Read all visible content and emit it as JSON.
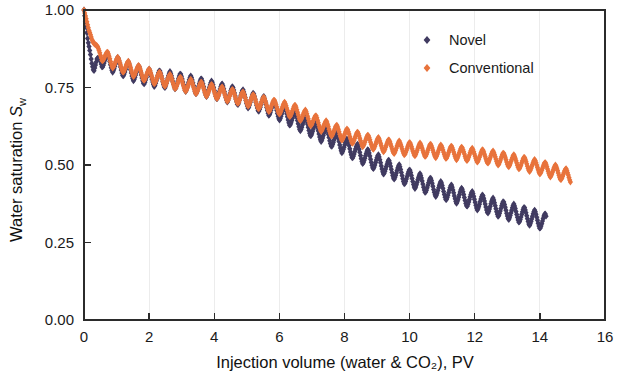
{
  "chart_data": {
    "type": "line",
    "title": "",
    "xlabel": "Injection volume (water & CO₂), PV",
    "ylabel": "Water saturation S_w",
    "ylabel_main": "Water saturation ",
    "ylabel_symbol": "S",
    "ylabel_subscript": "w",
    "xlim": [
      0,
      16
    ],
    "ylim": [
      0.0,
      1.0
    ],
    "xticks": [
      0,
      2,
      4,
      6,
      8,
      10,
      12,
      14,
      16
    ],
    "xticklabels": [
      "0",
      "2",
      "4",
      "6",
      "8",
      "10",
      "12",
      "14",
      "16"
    ],
    "yticks": [
      0.0,
      0.25,
      0.5,
      0.75,
      1.0
    ],
    "yticklabels": [
      "0.00",
      "0.25",
      "0.50",
      "0.75",
      "1.00"
    ],
    "grid": false,
    "legend_position": "top-right-inside",
    "oscillation": {
      "note": "both series show dense sawtooth cyclic oscillation about a declining trend",
      "period_pv": 0.32,
      "amplitude_novel": 0.028,
      "amplitude_conventional": 0.022
    },
    "series": [
      {
        "name": "Novel",
        "color": "#413b61",
        "marker": "diamond",
        "x_start": 0.0,
        "x_end": 14.2,
        "trend_x": [
          0.0,
          0.12,
          0.3,
          0.5,
          0.8,
          1.1,
          1.5,
          2.0,
          2.4,
          2.8,
          3.2,
          3.6,
          4.0,
          4.5,
          5.0,
          5.5,
          6.0,
          6.5,
          7.0,
          7.5,
          8.0,
          8.5,
          9.0,
          9.5,
          10.0,
          10.5,
          11.0,
          11.5,
          12.0,
          12.5,
          13.0,
          13.5,
          14.0,
          14.2
        ],
        "trend_y": [
          1.0,
          0.9,
          0.805,
          0.845,
          0.83,
          0.818,
          0.8,
          0.782,
          0.777,
          0.772,
          0.762,
          0.752,
          0.742,
          0.728,
          0.712,
          0.695,
          0.672,
          0.645,
          0.618,
          0.592,
          0.562,
          0.535,
          0.508,
          0.482,
          0.458,
          0.437,
          0.418,
          0.402,
          0.385,
          0.368,
          0.352,
          0.338,
          0.322,
          0.315
        ]
      },
      {
        "name": "Conventional",
        "color": "#e8733c",
        "marker": "diamond",
        "x_start": 0.0,
        "x_end": 14.95,
        "trend_x": [
          0.0,
          0.15,
          0.4,
          0.7,
          1.0,
          1.4,
          1.8,
          2.2,
          2.6,
          3.0,
          3.4,
          3.8,
          4.2,
          4.6,
          5.0,
          5.5,
          6.0,
          6.5,
          7.0,
          7.5,
          8.0,
          8.5,
          9.0,
          9.5,
          10.0,
          10.5,
          11.0,
          11.5,
          12.0,
          12.5,
          13.0,
          13.5,
          14.0,
          14.5,
          14.95
        ],
        "trend_y": [
          1.0,
          0.935,
          0.87,
          0.845,
          0.828,
          0.812,
          0.795,
          0.782,
          0.772,
          0.762,
          0.752,
          0.742,
          0.732,
          0.722,
          0.712,
          0.698,
          0.685,
          0.672,
          0.645,
          0.618,
          0.598,
          0.582,
          0.568,
          0.558,
          0.552,
          0.548,
          0.543,
          0.538,
          0.532,
          0.525,
          0.516,
          0.505,
          0.492,
          0.478,
          0.462
        ]
      }
    ]
  },
  "legend": {
    "entries": [
      {
        "label": "Novel",
        "color": "#413b61"
      },
      {
        "label": "Conventional",
        "color": "#e8733c"
      }
    ]
  }
}
